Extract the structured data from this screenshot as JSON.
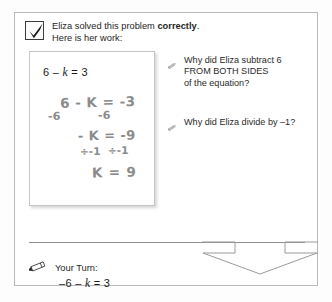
{
  "header": {
    "checkbox_state": "checked",
    "line1_prefix": "Eliza solved this problem ",
    "line1_emphasis": "correctly",
    "line1_suffix": ".",
    "line2": "Here is her work:"
  },
  "work_card": {
    "printed_equation_lhs": "6 – ",
    "printed_equation_var": "k",
    "printed_equation_rhs": " = 3",
    "handwriting": {
      "line1": "6 - K = -3",
      "line2_left": "-6",
      "line2_right": "-6",
      "line3": "- K = -9",
      "line4_left": "÷-1",
      "line4_right": "÷-1",
      "line5": "K = 9"
    }
  },
  "questions": [
    {
      "icon": "pencil-icon",
      "text": "Why did Eliza subtract 6\nFROM BOTH SIDES\nof the equation?"
    },
    {
      "icon": "pencil-icon",
      "text": "Why did Eliza divide by –1?"
    }
  ],
  "your_turn": {
    "icon": "pencil-eraser-icon",
    "label": "Your Turn:",
    "equation_lhs": "–6 – ",
    "equation_var": "k",
    "equation_rhs": " = 3"
  },
  "colors": {
    "frame_border": "#b9b9b9",
    "text": "#262626",
    "handwriting": "#8b8b8b",
    "divider": "#8f8f8f",
    "chevron_outline": "#9a9a9a"
  }
}
